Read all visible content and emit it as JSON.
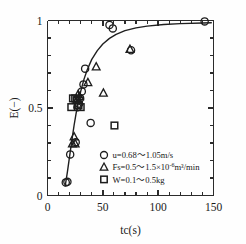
{
  "chart_data": {
    "type": "scatter",
    "title": "",
    "xlabel": "tc(s)",
    "ylabel": "E(-)",
    "xlim": [
      0,
      150
    ],
    "ylim": [
      0,
      1
    ],
    "xticks": [
      0,
      50,
      100,
      150
    ],
    "xtick_labels": [
      "0",
      "50",
      "100",
      "150"
    ],
    "yticks": [
      0,
      0.5,
      1
    ],
    "ytick_labels": [
      "0",
      "0.5",
      "1"
    ],
    "x_minor_step": 10,
    "y_minor_step": 0.1,
    "grid": false,
    "legend_position": "lower-right",
    "series": [
      {
        "name": "u=0.68~1.05m/s",
        "marker": "circle",
        "points": [
          [
            16.5,
            0.075
          ],
          [
            18.0,
            0.078
          ],
          [
            20.5,
            0.235
          ],
          [
            25.5,
            0.305
          ],
          [
            27.0,
            0.505
          ],
          [
            28.5,
            0.525
          ],
          [
            29.5,
            0.555
          ],
          [
            31.0,
            0.595
          ],
          [
            32.5,
            0.635
          ],
          [
            34.0,
            0.725
          ],
          [
            39.0,
            0.415
          ],
          [
            56.0,
            0.975
          ],
          [
            59.0,
            0.955
          ],
          [
            75.5,
            0.83
          ],
          [
            142.0,
            0.995
          ]
        ]
      },
      {
        "name": "Fs=0.5~1.5x10-6m3/min",
        "marker": "triangle",
        "points": [
          [
            22.5,
            0.295
          ],
          [
            24.0,
            0.335
          ],
          [
            25.0,
            0.295
          ],
          [
            26.5,
            0.545
          ],
          [
            27.5,
            0.575
          ],
          [
            29.0,
            0.565
          ],
          [
            36.5,
            0.645
          ],
          [
            44.0,
            0.735
          ],
          [
            50.5,
            0.585
          ],
          [
            74.5,
            0.835
          ]
        ]
      },
      {
        "name": "W=0.1~0.5kg",
        "marker": "square",
        "points": [
          [
            21.5,
            0.505
          ],
          [
            23.0,
            0.555
          ],
          [
            25.0,
            0.555
          ],
          [
            26.5,
            0.545
          ],
          [
            28.0,
            0.515
          ],
          [
            30.0,
            0.505
          ],
          [
            60.5,
            0.4
          ]
        ]
      }
    ],
    "fit_curve": {
      "description": "monotonic saturating fit through the data",
      "points": [
        [
          16.0,
          0.055
        ],
        [
          18.0,
          0.135
        ],
        [
          20.0,
          0.225
        ],
        [
          22.0,
          0.315
        ],
        [
          24.0,
          0.4
        ],
        [
          26.0,
          0.475
        ],
        [
          28.0,
          0.54
        ],
        [
          30.0,
          0.595
        ],
        [
          33.0,
          0.665
        ],
        [
          36.0,
          0.72
        ],
        [
          40.0,
          0.778
        ],
        [
          45.0,
          0.828
        ],
        [
          50.0,
          0.866
        ],
        [
          56.0,
          0.898
        ],
        [
          62.0,
          0.921
        ],
        [
          70.0,
          0.942
        ],
        [
          80.0,
          0.958
        ],
        [
          90.0,
          0.968
        ],
        [
          105.0,
          0.977
        ],
        [
          120.0,
          0.982
        ],
        [
          140.0,
          0.986
        ],
        [
          148.0,
          0.987
        ]
      ]
    }
  },
  "legend": {
    "entries": [
      {
        "marker": "circle",
        "label": "u=0.68～1.05m/s",
        "parts": {
          "pre": "u=0.68～1.05m/s",
          "sup": "",
          "post": ""
        }
      },
      {
        "marker": "triangle",
        "label": "Fs=0.5～1.5×10⁻⁶m³/min",
        "parts": {
          "pre": "Fs=0.5～1.5×10",
          "sup": "-6",
          "post": "m³/min"
        }
      },
      {
        "marker": "square",
        "label": "W=0.1～0.5kg",
        "parts": {
          "pre": "W=0.1～0.5kg",
          "sup": "",
          "post": ""
        }
      }
    ]
  },
  "axes": {
    "x_title": "tc(s)",
    "y_title": "E(−)",
    "x_labels": [
      "0",
      "50",
      "100",
      "150"
    ],
    "y_labels": [
      "0",
      "0.5",
      "1"
    ]
  },
  "colors": {
    "ink": "#1a1a1a",
    "curve": "#1f1f1f",
    "background": "#fefefe"
  }
}
